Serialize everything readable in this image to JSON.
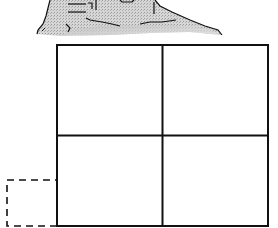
{
  "diagram": {
    "hand": {
      "icon": "hand-icon",
      "fill": "#c8c8c8",
      "stroke": "#111111"
    },
    "grid": {
      "rows": 2,
      "cols": 2,
      "stroke": "#111111",
      "x": 57,
      "y": 45,
      "width": 211,
      "height": 181
    },
    "dashed_square": {
      "stroke": "#111111",
      "x": 7,
      "y": 180,
      "width": 50,
      "height": 46
    }
  }
}
